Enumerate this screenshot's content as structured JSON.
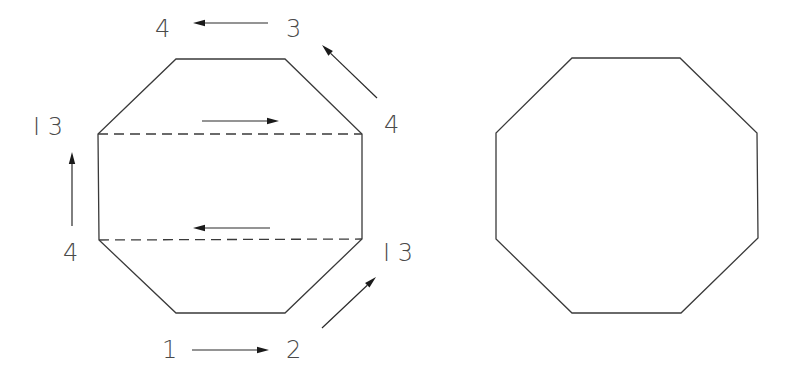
{
  "diagram": {
    "colors": {
      "stroke": "#3a3a3a",
      "arrow": "#1a1a1a",
      "label": "#4a4a4a",
      "background": "#ffffff"
    },
    "left_octagon": {
      "description": "Octagon divided by two horizontal dashed fold lines with directional arrows",
      "vertices": [
        [
          176,
          59
        ],
        [
          285,
          59
        ],
        [
          362,
          134
        ],
        [
          362,
          239
        ],
        [
          285,
          313
        ],
        [
          176,
          313
        ],
        [
          99,
          240
        ],
        [
          98,
          134
        ]
      ],
      "dashed_lines": [
        {
          "from": [
            98,
            134
          ],
          "to": [
            362,
            134
          ]
        },
        {
          "from": [
            99,
            240
          ],
          "to": [
            362,
            239
          ]
        }
      ],
      "labels": [
        {
          "id": "top-left-4",
          "text": "4",
          "x": 155,
          "y": 37
        },
        {
          "id": "top-right-3",
          "text": "3",
          "x": 286,
          "y": 37
        },
        {
          "id": "right-upper-4",
          "text": "4",
          "x": 384,
          "y": 133
        },
        {
          "id": "left-upper-I3",
          "text": "I 3",
          "x": 33,
          "y": 135
        },
        {
          "id": "left-lower-4",
          "text": "4",
          "x": 63,
          "y": 261
        },
        {
          "id": "right-lower-I3",
          "text": "I 3",
          "x": 383,
          "y": 261
        },
        {
          "id": "bottom-1",
          "text": "1",
          "x": 162,
          "y": 358
        },
        {
          "id": "bottom-2",
          "text": "2",
          "x": 286,
          "y": 358
        }
      ],
      "arrows": [
        {
          "id": "arrow-top",
          "from": [
            268,
            23
          ],
          "to": [
            193,
            23
          ],
          "direction": "left"
        },
        {
          "id": "arrow-top-right-diagonal",
          "from": [
            377,
            98
          ],
          "to": [
            322,
            45
          ],
          "direction": "up-left"
        },
        {
          "id": "arrow-inner-upper",
          "from": [
            202,
            121
          ],
          "to": [
            279,
            121
          ],
          "direction": "right"
        },
        {
          "id": "arrow-left-vertical",
          "from": [
            72,
            226
          ],
          "to": [
            72,
            152
          ],
          "direction": "up"
        },
        {
          "id": "arrow-inner-lower",
          "from": [
            270,
            228
          ],
          "to": [
            193,
            228
          ],
          "direction": "left"
        },
        {
          "id": "arrow-bottom-right-diagonal",
          "from": [
            322,
            328
          ],
          "to": [
            376,
            277
          ],
          "direction": "up-right"
        },
        {
          "id": "arrow-bottom",
          "from": [
            192,
            350
          ],
          "to": [
            269,
            350
          ],
          "direction": "right"
        }
      ]
    },
    "right_octagon": {
      "description": "Plain regular octagon outline",
      "vertices": [
        [
          572,
          58
        ],
        [
          680,
          58
        ],
        [
          757,
          133
        ],
        [
          758,
          238
        ],
        [
          681,
          313
        ],
        [
          572,
          313
        ],
        [
          496,
          239
        ],
        [
          496,
          133
        ]
      ]
    }
  }
}
